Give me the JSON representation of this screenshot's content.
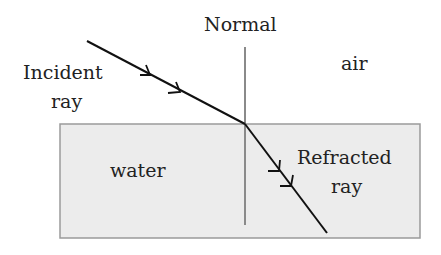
{
  "diagram": {
    "labels": {
      "normal": "Normal",
      "air": "air",
      "incident_line1": "Incident",
      "incident_line2": "ray",
      "water": "water",
      "refracted_line1": "Refracted",
      "refracted_line2": "ray"
    },
    "colors": {
      "water_fill": "#ececec",
      "water_border": "#9a9a9a",
      "normal_line": "#8a8a8a",
      "ray": "#111111",
      "text": "#222222"
    }
  }
}
